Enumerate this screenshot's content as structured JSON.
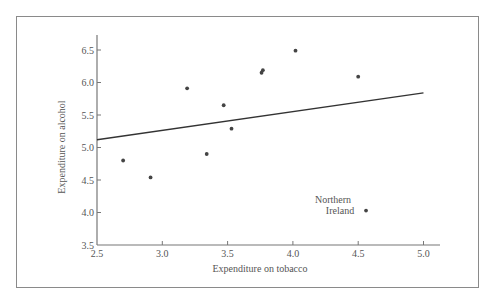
{
  "chart_data": {
    "type": "scatter",
    "title": "",
    "xlabel": "Expenditure on tobacco",
    "ylabel": "Expenditure on alcohol",
    "xlim": [
      2.5,
      5.1
    ],
    "ylim": [
      3.5,
      6.75
    ],
    "x_ticks": [
      2.5,
      3.0,
      3.5,
      4.0,
      4.5,
      5.0
    ],
    "x_tick_labels": [
      "2.5",
      "3.0",
      "3.5",
      "4.0",
      "4.5",
      "5.0"
    ],
    "y_ticks": [
      3.5,
      4.0,
      4.5,
      5.0,
      5.5,
      6.0,
      6.5
    ],
    "y_tick_labels": [
      "3.5",
      "4.0",
      "4.5",
      "5.0",
      "5.5",
      "6.0",
      "6.5"
    ],
    "grid": false,
    "legend": null,
    "series": [
      {
        "name": "Regions",
        "points": [
          {
            "x": 2.7,
            "y": 4.8
          },
          {
            "x": 2.91,
            "y": 4.54
          },
          {
            "x": 3.19,
            "y": 5.91
          },
          {
            "x": 3.34,
            "y": 4.9
          },
          {
            "x": 3.47,
            "y": 5.65
          },
          {
            "x": 3.53,
            "y": 5.29
          },
          {
            "x": 3.76,
            "y": 6.15
          },
          {
            "x": 3.77,
            "y": 6.19
          },
          {
            "x": 4.02,
            "y": 6.49
          },
          {
            "x": 4.5,
            "y": 6.09
          },
          {
            "x": 4.56,
            "y": 4.03,
            "label": "Northern Ireland"
          }
        ]
      }
    ],
    "fit_line": {
      "x1": 2.5,
      "y1": 5.12,
      "x2": 5.0,
      "y2": 5.84
    },
    "annotations": [
      {
        "text_lines": [
          "Northern",
          "Ireland"
        ],
        "x": 4.56,
        "y": 4.03
      }
    ],
    "colors": {
      "points": "#444444",
      "line": "#333333",
      "axis": "#777777",
      "frame": "#8a8a8a",
      "text": "#555555"
    }
  },
  "labels": {
    "xlabel": "Expenditure on tobacco",
    "ylabel": "Expenditure on alcohol",
    "annot_line1": "Northern",
    "annot_line2": "Ireland"
  }
}
